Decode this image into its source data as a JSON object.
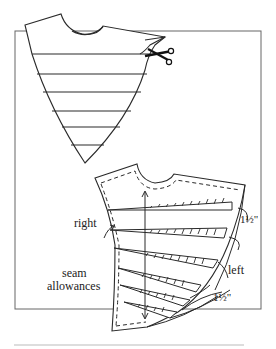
{
  "figure": {
    "type": "sewing pattern diagram",
    "top_piece": {
      "description": "pattern piece with horizontal slash lines being cut with scissors",
      "slash_lines": 6,
      "tool": "scissors-icon"
    },
    "bottom_piece": {
      "description": "pattern piece spread at slash lines with seam allowances and grainline arrow",
      "spread_wedges": 6
    },
    "labels": {
      "right": "right",
      "left": "left",
      "seam_allowances_line1": "seam",
      "seam_allowances_line2": "allowances",
      "measurement_top": "1½\"",
      "measurement_bottom": "1½\""
    },
    "colors": {
      "line": "#2a2a2a",
      "frame": "#555555",
      "background": "#ffffff"
    }
  }
}
